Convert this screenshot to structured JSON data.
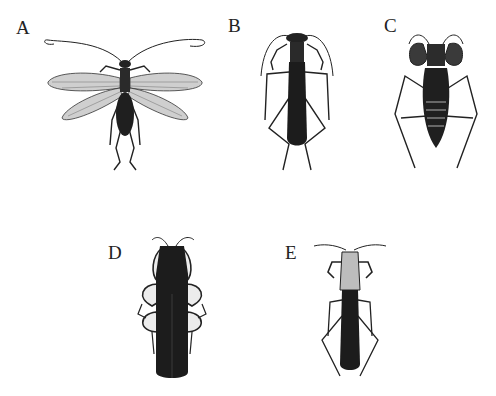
{
  "plate": {
    "background": "#ffffff",
    "ink_color": "#1c1c1c",
    "panels": [
      {
        "label": "A",
        "subject": "winged insect with lace-veined wings, long antennae"
      },
      {
        "label": "B",
        "subject": "slender dark-bodied insect with raptorial forelegs"
      },
      {
        "label": "C",
        "subject": "insect with enlarged raptorial forelegs and segmented abdomen"
      },
      {
        "label": "D",
        "subject": "broad dark elongate insect with folded forelegs"
      },
      {
        "label": "E",
        "subject": "narrow dark insect with long thorax and antennae"
      }
    ]
  }
}
